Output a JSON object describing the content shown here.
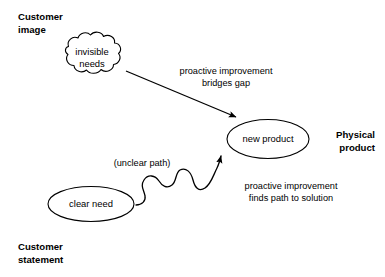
{
  "diagram": {
    "background_color": "#ffffff",
    "stroke_color": "#000000",
    "zones": [
      {
        "id": "customer-image",
        "label": "Customer\nimage",
        "x": 18,
        "y": 10,
        "align": "left"
      },
      {
        "id": "physical-product",
        "label": "Physical\nproduct",
        "x": 375,
        "y": 128,
        "align": "right"
      },
      {
        "id": "customer-statement",
        "label": "Customer\nstatement",
        "x": 18,
        "y": 240,
        "align": "left"
      }
    ],
    "nodes": [
      {
        "id": "invisible-needs",
        "shape": "cloud",
        "label_line1": "invisible",
        "label_line2": "needs",
        "cx": 92,
        "cy": 58
      },
      {
        "id": "new-product",
        "shape": "ellipse",
        "label": "new product",
        "cx": 268,
        "cy": 139
      },
      {
        "id": "clear-need",
        "shape": "ellipse",
        "label": "clear need",
        "cx": 91,
        "cy": 204
      }
    ],
    "edges": [
      {
        "id": "bridges-gap",
        "style": "straight",
        "from": "invisible-needs",
        "to": "new-product",
        "label_line1": "proactive improvement",
        "label_line2": "bridges gap",
        "label_cx": 226,
        "label_y": 65
      },
      {
        "id": "finds-path",
        "style": "wavy",
        "from": "clear-need",
        "to": "new-product",
        "label_line1": "proactive improvement",
        "label_line2": "finds path to solution",
        "label_cx": 291,
        "label_y": 180
      }
    ],
    "annotations": [
      {
        "id": "unclear-path",
        "text": "(unclear path)",
        "cx": 142,
        "y": 157
      }
    ]
  }
}
